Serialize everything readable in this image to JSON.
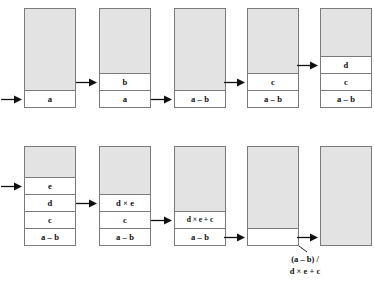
{
  "figure": {
    "background_color": "#ffffff",
    "stack_free_color": "#e3e3e3",
    "stack_cell_color": "#ffffff",
    "stack_border_color": "#7b7b7b",
    "text_color": "#101010"
  },
  "rows": [
    {
      "name": "top-row",
      "steps": [
        {
          "id": "step-1",
          "pointer_index": 0,
          "cells": [
            "a"
          ],
          "has_inbound_arrow": true
        },
        {
          "id": "step-2",
          "pointer_index": 1,
          "cells": [
            "a",
            "b"
          ],
          "has_inbound_arrow": true
        },
        {
          "id": "step-3",
          "pointer_index": 0,
          "cells": [
            "a – b"
          ],
          "has_inbound_arrow": true
        },
        {
          "id": "step-4",
          "pointer_index": 1,
          "cells": [
            "a – b",
            "c"
          ],
          "has_inbound_arrow": true
        },
        {
          "id": "step-5",
          "pointer_index": 2,
          "cells": [
            "a – b",
            "c",
            "d"
          ],
          "has_inbound_arrow": true
        }
      ]
    },
    {
      "name": "bottom-row",
      "steps": [
        {
          "id": "step-6",
          "pointer_index": 3,
          "cells": [
            "a – b",
            "c",
            "d",
            "e"
          ],
          "has_inbound_arrow": true
        },
        {
          "id": "step-7",
          "pointer_index": 2,
          "cells": [
            "a – b",
            "c",
            "d × e"
          ],
          "has_inbound_arrow": true
        },
        {
          "id": "step-8",
          "pointer_index": 1,
          "cells": [
            "a – b",
            "d × e + c"
          ],
          "has_inbound_arrow": true
        },
        {
          "id": "step-9",
          "pointer_index": 0,
          "cells": [
            ""
          ],
          "has_inbound_arrow": true,
          "annotation": {
            "line1": "(a – b) /",
            "line2": "d × e + c"
          }
        },
        {
          "id": "step-10",
          "pointer_index": -1,
          "cells": [],
          "has_inbound_arrow": true
        }
      ]
    }
  ]
}
